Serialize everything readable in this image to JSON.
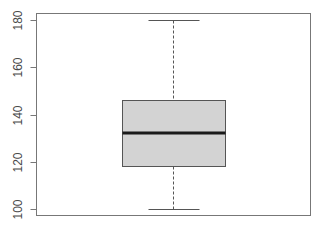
{
  "chart_data": {
    "type": "boxplot",
    "title": "",
    "xlabel": "",
    "ylabel": "",
    "ylim": [
      97,
      183
    ],
    "grid": false,
    "legend": null,
    "y_ticks": [
      100,
      120,
      140,
      160,
      180
    ],
    "y_tick_labels": [
      "100",
      "120",
      "140",
      "160",
      "180"
    ],
    "series": [
      {
        "name": "",
        "min": 100,
        "q1": 118,
        "median": 132,
        "q3": 146,
        "max": 180,
        "outliers": []
      }
    ]
  },
  "colors": {
    "box_fill": "#d3d3d3",
    "box_border": "#555555",
    "median": "#1a1a1a",
    "whisker": "#555555",
    "frame": "#777777",
    "tick_label": "#4a4a4a"
  },
  "axis": {
    "ticks": [
      {
        "label": "100",
        "value": 100
      },
      {
        "label": "120",
        "value": 120
      },
      {
        "label": "140",
        "value": 140
      },
      {
        "label": "160",
        "value": 160
      },
      {
        "label": "180",
        "value": 180
      }
    ]
  }
}
